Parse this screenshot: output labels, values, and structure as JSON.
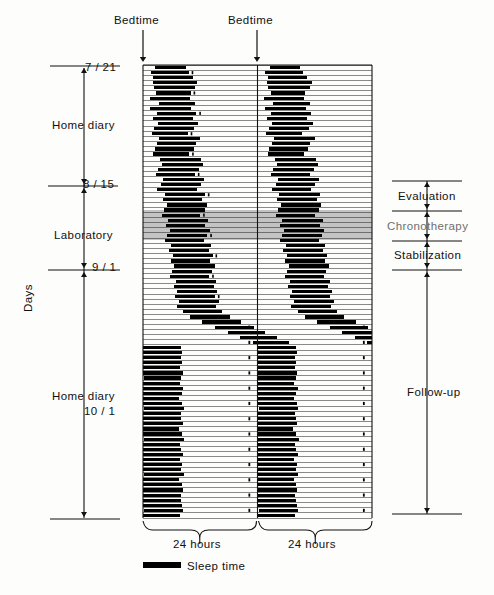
{
  "figure": {
    "legend": {
      "swatch": "sleep-bar",
      "label": "Sleep time"
    },
    "top_markers": [
      {
        "name": "bedtime-left",
        "label": "Bedtime",
        "x": 143
      },
      {
        "name": "bedtime-right",
        "label": "Bedtime",
        "x": 257
      }
    ],
    "bottom_axis": [
      {
        "label": "24 hours",
        "from": 143,
        "to": 257
      },
      {
        "label": "24 hours",
        "from": 258,
        "to": 372
      }
    ],
    "y_axis": {
      "label": "Days",
      "date_ticks": [
        {
          "label": "7 / 21",
          "y": 68
        },
        {
          "label": "8 / 15",
          "y": 185
        },
        {
          "label": "9 / 1",
          "y": 268
        }
      ],
      "phases": [
        {
          "label": "Home diary",
          "from": 68,
          "to": 185
        },
        {
          "label": "Laboratory",
          "from": 185,
          "to": 268
        },
        {
          "label": "Home diary",
          "from": 268,
          "to": 518
        },
        {
          "label": "10 / 1",
          "from": 268,
          "to": 518,
          "sub": true
        }
      ]
    },
    "right_phases": [
      {
        "label": "Evaluation",
        "from": 181,
        "to": 210,
        "grey": false
      },
      {
        "label": "Chronotherapy",
        "from": 210,
        "to": 240,
        "grey": true
      },
      {
        "label": "Stabilization",
        "from": 240,
        "to": 269,
        "grey": false
      },
      {
        "label": "Follow-up",
        "from": 269,
        "to": 514,
        "grey": false
      }
    ],
    "shaded_band": {
      "name": "chronotherapy-band",
      "from": 210,
      "to": 240,
      "color": "#b9b9b9"
    }
  },
  "chart_data": {
    "type": "actogram",
    "plot_kind": "double-plotted raster (48 h per row)",
    "xlabel": "24 hours (double plotted)",
    "ylabel": "Days",
    "xlim_hours": [
      0,
      48
    ],
    "day_count": 88,
    "row_height_px": 5.15,
    "plot_box": {
      "x0": 143,
      "x1": 372,
      "y0": 65,
      "y1": 518
    },
    "midline_x": 257.5,
    "legend": [
      "Sleep time"
    ],
    "grid": "horizontal day rules only",
    "date_labels": [
      "7/21",
      "8/15",
      "9/1",
      "10/1"
    ],
    "phase_labels": [
      "Home diary",
      "Laboratory",
      "Home diary",
      "Evaluation",
      "Chronotherapy",
      "Stabilization",
      "Follow-up"
    ],
    "sleep_episodes_hours": [
      [
        2.6,
        9.0
      ],
      [
        1.6,
        9.6
      ],
      [
        2.2,
        10.4
      ],
      [
        2.0,
        11.4
      ],
      [
        2.3,
        11.0
      ],
      [
        2.8,
        10.0
      ],
      [
        1.4,
        9.8
      ],
      [
        3.3,
        10.9
      ],
      [
        1.5,
        10.1
      ],
      [
        2.9,
        11.2
      ],
      [
        2.0,
        10.4
      ],
      [
        3.1,
        11.6
      ],
      [
        2.4,
        10.7
      ],
      [
        1.8,
        9.4
      ],
      [
        3.4,
        12.0
      ],
      [
        3.0,
        11.1
      ],
      [
        2.5,
        10.6
      ],
      [
        2.1,
        9.7
      ],
      [
        3.6,
        12.2
      ],
      [
        4.0,
        12.6
      ],
      [
        3.2,
        11.8
      ],
      [
        2.8,
        10.9
      ],
      [
        4.2,
        12.8
      ],
      [
        3.8,
        12.1
      ],
      [
        3.0,
        11.3
      ],
      [
        4.6,
        13.0
      ],
      [
        4.1,
        12.4
      ],
      [
        5.0,
        13.4
      ],
      [
        4.4,
        12.9
      ],
      [
        3.9,
        12.0
      ],
      [
        5.2,
        13.7
      ],
      [
        4.8,
        13.1
      ],
      [
        5.6,
        14.0
      ],
      [
        5.1,
        13.5
      ],
      [
        4.7,
        12.8
      ],
      [
        5.9,
        14.2
      ],
      [
        5.4,
        13.8
      ],
      [
        6.2,
        14.6
      ],
      [
        5.8,
        14.1
      ],
      [
        6.6,
        15.0
      ],
      [
        6.1,
        14.4
      ],
      [
        5.7,
        13.9
      ],
      [
        6.9,
        15.2
      ],
      [
        6.4,
        14.8
      ],
      [
        7.2,
        15.6
      ],
      [
        6.8,
        15.1
      ],
      [
        7.6,
        16.0
      ],
      [
        7.1,
        15.4
      ],
      [
        8.4,
        16.6
      ],
      [
        9.9,
        18.2
      ],
      [
        12.4,
        20.6
      ],
      [
        15.1,
        23.2
      ],
      [
        17.8,
        25.6
      ],
      [
        20.4,
        28.0
      ],
      [
        23.0,
        30.6
      ],
      [
        0.0,
        8.0
      ],
      [
        0.0,
        8.2
      ],
      [
        0.0,
        7.9
      ],
      [
        0.1,
        8.1
      ],
      [
        0.0,
        7.8
      ],
      [
        0.0,
        8.3
      ],
      [
        0.2,
        8.0
      ],
      [
        0.0,
        7.7
      ],
      [
        0.0,
        8.4
      ],
      [
        0.1,
        8.1
      ],
      [
        0.0,
        7.6
      ],
      [
        0.0,
        8.2
      ],
      [
        0.3,
        8.5
      ],
      [
        0.0,
        7.9
      ],
      [
        0.0,
        8.0
      ],
      [
        0.1,
        8.3
      ],
      [
        0.0,
        7.5
      ],
      [
        0.0,
        8.1
      ],
      [
        0.2,
        8.6
      ],
      [
        0.0,
        7.8
      ],
      [
        0.0,
        8.0
      ],
      [
        0.0,
        8.4
      ],
      [
        0.1,
        7.7
      ],
      [
        0.0,
        8.2
      ],
      [
        0.0,
        8.0
      ],
      [
        0.2,
        8.5
      ],
      [
        0.0,
        7.6
      ],
      [
        0.0,
        8.1
      ],
      [
        0.0,
        8.3
      ],
      [
        0.1,
        7.9
      ],
      [
        0.0,
        8.0
      ],
      [
        0.0,
        8.2
      ],
      [
        0.3,
        8.4
      ],
      [
        0.0,
        7.8
      ]
    ]
  }
}
